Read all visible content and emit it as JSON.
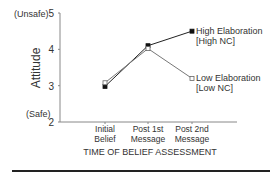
{
  "chart_data": {
    "type": "line",
    "title": "",
    "xlabel": "TIME OF BELIEF ASSESSMENT",
    "ylabel": "Attitude",
    "ylim": [
      2,
      5
    ],
    "yticks": [
      2,
      3,
      4,
      5
    ],
    "y_annotations": {
      "top": "(Unsafe)",
      "bottom": "(Safe)"
    },
    "categories": [
      [
        "Initial",
        "Belief"
      ],
      [
        "Post 1st",
        "Message"
      ],
      [
        "Post 2nd",
        "Message"
      ]
    ],
    "series": [
      {
        "name": "High Elaboration [High NC]",
        "label_line1": "High Elaboration",
        "label_line2": "[High NC]",
        "marker": "filled-square",
        "values": [
          2.98,
          4.1,
          4.5
        ]
      },
      {
        "name": "Low Elaboration [Low NC]",
        "label_line1": "Low Elaboration",
        "label_line2": "[Low NC]",
        "marker": "open-square",
        "values": [
          3.08,
          4.02,
          3.2
        ]
      }
    ],
    "grid": false,
    "legend_position": "inline-right"
  }
}
